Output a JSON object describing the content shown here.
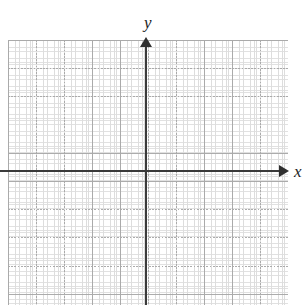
{
  "figure": {
    "kind": "cartesian-coordinate-grid",
    "background_color": "#ffffff",
    "width": 302,
    "height": 305,
    "axis_color": "#3b3b3b",
    "minor_grid_color": "#d8d8d8",
    "major_grid_color": "#a8a8a8"
  },
  "labels": {
    "y_axis": "y",
    "x_axis": "x",
    "scan_artifact": "y"
  },
  "chart_data": {
    "type": "scatter",
    "title": "",
    "subtitle": "",
    "xlabel": "x",
    "ylabel": "y",
    "series": [
      {
        "name": "plotted-points",
        "x": [],
        "y": []
      }
    ],
    "annotations": [],
    "legend": [],
    "legend_position": "none",
    "grid": true,
    "grid_style": "dotted-minor-with-dashed-major",
    "minor_cells_per_major": 5,
    "xlim": [
      -25,
      25
    ],
    "ylim": [
      -24,
      24
    ],
    "x_major_ticks": [],
    "y_major_ticks": [],
    "x_tick_labels": [],
    "y_tick_labels": [],
    "origin_label": "",
    "x_axis_arrow": "right",
    "y_axis_arrow": "up"
  }
}
